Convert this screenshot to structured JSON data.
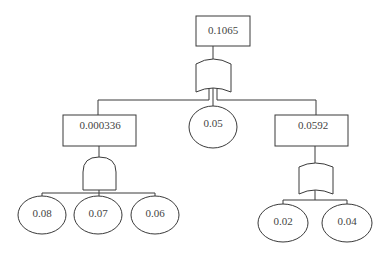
{
  "diagram": {
    "type": "fault-tree",
    "top_event": {
      "label": "0.1065",
      "gate": "OR"
    },
    "children": [
      {
        "label": "0.000336",
        "kind": "intermediate-event",
        "gate": "AND",
        "basic_events": [
          "0.08",
          "0.07",
          "0.06"
        ]
      },
      {
        "label": "0.05",
        "kind": "basic-event"
      },
      {
        "label": "0.0592",
        "kind": "intermediate-event",
        "gate": "OR",
        "basic_events": [
          "0.02",
          "0.04"
        ]
      }
    ]
  }
}
